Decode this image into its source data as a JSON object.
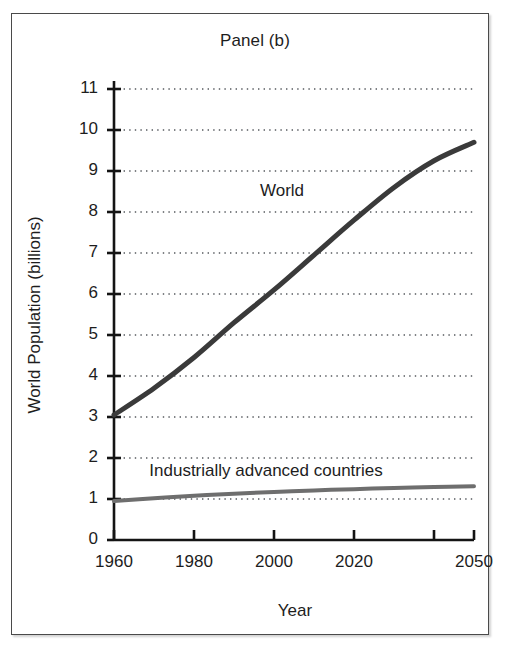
{
  "chart_data": {
    "type": "line",
    "title": "Panel (b)",
    "xlabel": "Year",
    "ylabel": "World Population (billions)",
    "xlim": [
      1960,
      2050
    ],
    "ylim": [
      0,
      11
    ],
    "grid": true,
    "grid_style": "dotted-horizontal",
    "legend": "inline-labels",
    "x_tick_labels": [
      "1960",
      "1980",
      "2000",
      "2020",
      "2050"
    ],
    "x_tick_values": [
      1960,
      1980,
      2000,
      2020,
      2050
    ],
    "x_tick_positions_all": [
      1960,
      1980,
      2000,
      2020,
      2040,
      2050
    ],
    "y_tick_labels": [
      "0",
      "1",
      "2",
      "3",
      "4",
      "5",
      "6",
      "7",
      "8",
      "9",
      "10",
      "11"
    ],
    "y_tick_values": [
      0,
      1,
      2,
      3,
      4,
      5,
      6,
      7,
      8,
      9,
      10,
      11
    ],
    "x": [
      1960,
      1970,
      1980,
      1990,
      2000,
      2010,
      2020,
      2030,
      2040,
      2050
    ],
    "series": [
      {
        "name": "World",
        "color": "#3a3a3a",
        "line_width": 5,
        "label_text": "World",
        "values": [
          3.05,
          3.7,
          4.45,
          5.3,
          6.1,
          6.95,
          7.8,
          8.6,
          9.25,
          9.7
        ]
      },
      {
        "name": "Industrially advanced countries",
        "color": "#6e6e6e",
        "line_width": 4,
        "label_text": "Industrially advanced countries",
        "values": [
          0.95,
          1.02,
          1.08,
          1.13,
          1.17,
          1.21,
          1.24,
          1.27,
          1.29,
          1.31
        ]
      }
    ],
    "annotations": [
      {
        "text": "World",
        "x": 2002,
        "y": 8.5
      },
      {
        "text": "Industrially advanced countries",
        "x": 1998,
        "y": 1.65
      }
    ]
  },
  "axis_color": "#141414",
  "grid_color": "#55595e",
  "frame_color": "#4a4a4a",
  "background": "#ffffff"
}
